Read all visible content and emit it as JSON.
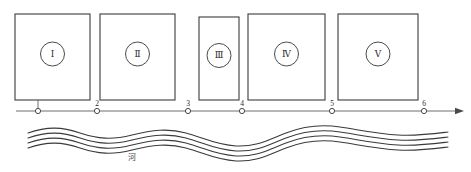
{
  "figure": {
    "width": 471,
    "height": 172,
    "background": "#ffffff",
    "stroke_color": "#3b3b3b",
    "axis_color": "#6e6e6e",
    "river_color": "#3a3a3a"
  },
  "plots": [
    {
      "id": "plot-1",
      "label": "Ⅰ",
      "x": 15,
      "y": 14,
      "w": 75,
      "h": 86
    },
    {
      "id": "plot-2",
      "label": "Ⅱ",
      "x": 100,
      "y": 14,
      "w": 75,
      "h": 86
    },
    {
      "id": "plot-3",
      "label": "Ⅲ",
      "x": 199,
      "y": 17,
      "w": 40,
      "h": 83
    },
    {
      "id": "plot-4",
      "label": "Ⅳ",
      "x": 248,
      "y": 14,
      "w": 77,
      "h": 86
    },
    {
      "id": "plot-5",
      "label": "Ⅴ",
      "x": 338,
      "y": 14,
      "w": 80,
      "h": 86
    }
  ],
  "marker_radius": 12,
  "axis": {
    "y": 111,
    "x_start": 16,
    "x_end": 455,
    "arrow": true,
    "ticks": [
      {
        "name": "tick-1",
        "x": 38,
        "label": "",
        "has_stem": true
      },
      {
        "name": "tick-2",
        "x": 97,
        "label": "2",
        "has_stem": false
      },
      {
        "name": "tick-3",
        "x": 188,
        "label": "3",
        "has_stem": false
      },
      {
        "name": "tick-4",
        "x": 242,
        "label": "4",
        "has_stem": false
      },
      {
        "name": "tick-5",
        "x": 332,
        "label": "5",
        "has_stem": false
      },
      {
        "name": "tick-6",
        "x": 424,
        "label": "6",
        "has_stem": false
      }
    ]
  },
  "river": {
    "label": "河",
    "label_x": 132,
    "label_y": 160,
    "line_count": 4,
    "line_spacing": 5,
    "base_y": 133,
    "path": "M 28,133 C 48,126 62,127 80,133 C 98,139 112,140 132,135 C 152,130 168,128 186,133 C 204,138 216,145 236,146 C 256,147 268,140 286,133 C 304,126 320,124 340,127 C 360,130 378,134 398,135 C 418,136 432,134 448,132"
  }
}
